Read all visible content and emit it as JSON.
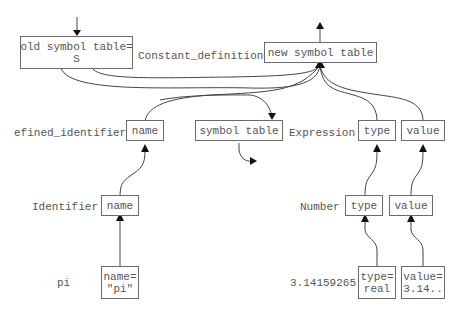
{
  "diagram": {
    "production": {
      "label": "Constant_definition",
      "inherited": "old symbol table=\nS",
      "synthesized": "new symbol table"
    },
    "defined_identifier": {
      "label": "efined_identifier",
      "attr": "name"
    },
    "symbol_table_node": {
      "attr": "symbol table"
    },
    "expression": {
      "label": "Expression",
      "attrs": [
        "type",
        "value"
      ]
    },
    "identifier": {
      "label": "Identifier",
      "attr": "name"
    },
    "number": {
      "label": "Number",
      "attrs": [
        "type",
        "value"
      ]
    },
    "leaf_pi": {
      "label": "pi",
      "attr": "name=\n\"pi\""
    },
    "leaf_number": {
      "label": "3.14159265",
      "attrs": [
        "type=\nreal",
        "value=\n3.14.."
      ]
    }
  }
}
